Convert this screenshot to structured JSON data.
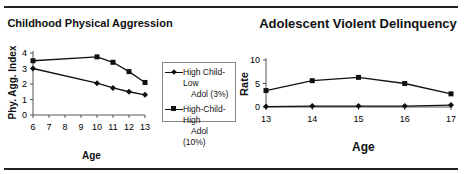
{
  "chart_data": [
    {
      "type": "line",
      "title": "Childhood Physical Aggression",
      "xlabel": "Age",
      "ylabel": "Phy. Agg. Index",
      "x": [
        6,
        10,
        11,
        12,
        13
      ],
      "xticks": [
        "6",
        "7",
        "8",
        "9",
        "10",
        "11",
        "12",
        "13"
      ],
      "yticks": [
        "0",
        "1",
        "2",
        "3",
        "4"
      ],
      "ylim": [
        0,
        4
      ],
      "grid": false,
      "legend_position": "right",
      "series": [
        {
          "name": "High Child-Low Adol (3%)",
          "marker": "diamond",
          "values": [
            3.0,
            2.05,
            1.75,
            1.5,
            1.3
          ]
        },
        {
          "name": "High-Child-High Adol (10%)",
          "marker": "square",
          "values": [
            3.5,
            3.75,
            3.4,
            2.8,
            2.1
          ]
        }
      ]
    },
    {
      "type": "line",
      "title": "Adolescent Violent Delinquency",
      "xlabel": "Age",
      "ylabel": "Rate",
      "x": [
        13,
        14,
        15,
        16,
        17
      ],
      "xticks": [
        "13",
        "14",
        "15",
        "16",
        "17"
      ],
      "yticks": [
        "0",
        "5",
        "10"
      ],
      "ylim": [
        0,
        10
      ],
      "grid": false,
      "series": [
        {
          "name": "High Child-Low Adol (3%)",
          "marker": "diamond",
          "values": [
            0.1,
            0.2,
            0.2,
            0.2,
            0.4
          ]
        },
        {
          "name": "High-Child-High Adol (10%)",
          "marker": "square",
          "values": [
            3.5,
            5.6,
            6.3,
            5.0,
            2.8
          ]
        }
      ]
    }
  ],
  "left": {
    "title": "Childhood Physical Aggression",
    "ylabel": "Phy. Agg. Index",
    "xlabel": "Age",
    "legend": [
      {
        "line1": "High Child-Low",
        "line2": "Adol (3%)"
      },
      {
        "line1": "High-Child-High",
        "line2": "Adol (10%)"
      }
    ]
  },
  "right": {
    "title": "Adolescent Violent Delinquency",
    "ylabel": "Rate",
    "xlabel": "Age"
  }
}
